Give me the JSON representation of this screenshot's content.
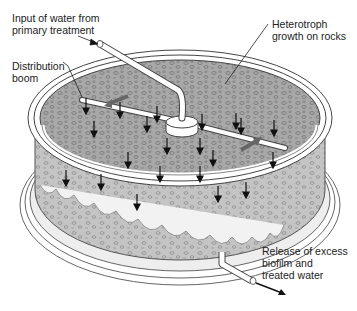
{
  "labels": {
    "input": "Input of water from\nprimary treatment",
    "boom": "Distribution\nboom",
    "heterotroph": "Heterotroph\ngrowth on rocks",
    "release": "Release of excess\nbiofilm and\ntreated water"
  },
  "colors": {
    "rock_fill": "#a9a9a9",
    "outline": "#444444",
    "tank_wall": "#f4f4f4",
    "arrow": "#111111",
    "boom_arrow": "#666666"
  }
}
